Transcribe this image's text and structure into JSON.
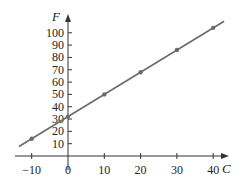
{
  "chart_data": {
    "type": "line",
    "title": "",
    "xlabel": "C",
    "ylabel": "F",
    "x_ticks": [
      -10,
      0,
      10,
      20,
      30,
      40
    ],
    "y_ticks": [
      10,
      20,
      30,
      40,
      50,
      60,
      70,
      80,
      90,
      100
    ],
    "xlim": [
      -14,
      45
    ],
    "ylim": [
      0,
      108
    ],
    "grid": false,
    "legend": null,
    "series": [
      {
        "name": "F = 1.8C + 32",
        "x": [
          -10,
          0,
          10,
          20,
          30,
          40
        ],
        "y": [
          14,
          32,
          50,
          68,
          86,
          104
        ]
      }
    ],
    "line_extent": {
      "x_start": -13.5,
      "x_end": 43
    },
    "colors": {
      "line": "#6b6b6b",
      "axis": "#333333",
      "marker": "#6b6b6b"
    }
  }
}
